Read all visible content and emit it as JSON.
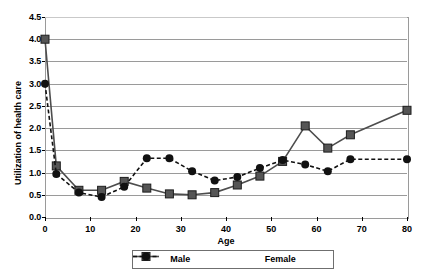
{
  "chart_data": {
    "type": "line",
    "title": "",
    "xlabel": "Age",
    "ylabel": "Utilization of health care",
    "xlim": [
      0,
      80
    ],
    "ylim": [
      0,
      4.5
    ],
    "grid": true,
    "legend_position": "bottom",
    "xticks": [
      "0",
      "10",
      "20",
      "30",
      "40",
      "50",
      "60",
      "70",
      "80"
    ],
    "xtick_values": [
      0,
      10,
      20,
      30,
      40,
      50,
      60,
      70,
      80
    ],
    "yticks": [
      "0.0",
      "0.5",
      "1.0",
      "1.5",
      "2.0",
      "2.5",
      "3.0",
      "3.5",
      "4.0",
      "4.5"
    ],
    "ytick_values": [
      0.0,
      0.5,
      1.0,
      1.5,
      2.0,
      2.5,
      3.0,
      3.5,
      4.0,
      4.5
    ],
    "x": [
      0,
      2.5,
      7.5,
      12.5,
      17.5,
      22.5,
      27.5,
      32.5,
      37.5,
      42.5,
      47.5,
      52.5,
      57.5,
      62.5,
      67.5,
      80
    ],
    "series": [
      {
        "name": "Male",
        "marker": "square",
        "linestyle": "solid",
        "color": "#4d4d4d",
        "values": [
          4.0,
          1.15,
          0.6,
          0.6,
          0.8,
          0.65,
          0.52,
          0.5,
          0.55,
          0.72,
          0.92,
          1.25,
          2.05,
          1.55,
          1.85,
          2.4
        ]
      },
      {
        "name": "Female",
        "marker": "circle",
        "linestyle": "dashed",
        "color": "#111111",
        "values": [
          3.0,
          0.97,
          0.55,
          0.45,
          0.68,
          1.32,
          1.32,
          1.03,
          0.82,
          0.9,
          1.1,
          1.28,
          1.18,
          1.03,
          1.3,
          1.3
        ]
      }
    ]
  },
  "legend": {
    "items": [
      {
        "label": "Male"
      },
      {
        "label": "Female"
      }
    ]
  }
}
